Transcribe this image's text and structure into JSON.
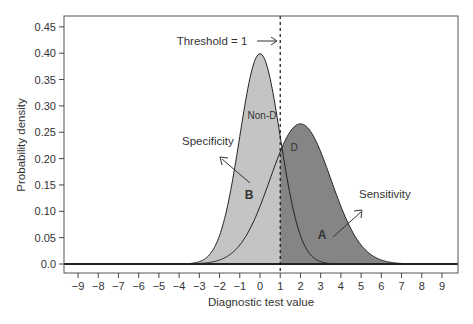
{
  "chart_data": {
    "type": "area",
    "title": "",
    "xlabel": "Diagnostic test value",
    "ylabel": "Probability density",
    "xlim": [
      -9.7,
      9.8
    ],
    "ylim": [
      -0.02,
      0.47
    ],
    "x_ticks": [
      -9,
      -8,
      -7,
      -6,
      -5,
      -4,
      -3,
      -2,
      -1,
      0,
      1,
      2,
      3,
      4,
      5,
      6,
      7,
      8,
      9
    ],
    "x_tick_labels": [
      "−9",
      "−8",
      "−7",
      "−6",
      "−5",
      "−4",
      "−3",
      "−2",
      "−1",
      "0",
      "1",
      "2",
      "3",
      "4",
      "5",
      "6",
      "7",
      "8",
      "9"
    ],
    "y_ticks": [
      0.0,
      0.05,
      0.1,
      0.15,
      0.2,
      0.25,
      0.3,
      0.35,
      0.4,
      0.45
    ],
    "y_tick_labels": [
      "0.0",
      "0.05",
      "0.10",
      "0.15",
      "0.20",
      "0.25",
      "0.30",
      "0.35",
      "0.40",
      "0.45"
    ],
    "grid": false,
    "legend": null,
    "series": [
      {
        "name": "Non-D",
        "distribution": "normal",
        "mean": 0,
        "sd": 1.0,
        "peak": 0.4,
        "fill": "#c4c4c4"
      },
      {
        "name": "D",
        "distribution": "normal",
        "mean": 2,
        "sd": 1.5,
        "peak": 0.266,
        "fill": "#858585"
      }
    ],
    "threshold": {
      "x": 1,
      "label": "Threshold = 1",
      "style": "dashed"
    },
    "annotations": [
      {
        "text": "Threshold = 1",
        "x": -0.6,
        "y": 0.41
      },
      {
        "text": "Non-D",
        "x": 0.05,
        "y": 0.285
      },
      {
        "text": "D",
        "x": 1.4,
        "y": 0.225
      },
      {
        "text": "Specificity",
        "x": -3.2,
        "y": 0.235
      },
      {
        "text": "B",
        "x": -0.55,
        "y": 0.13
      },
      {
        "text": "Sensitivity",
        "x": 5.1,
        "y": 0.135
      },
      {
        "text": "A",
        "x": 3.2,
        "y": 0.04
      }
    ],
    "regions": [
      {
        "label": "B",
        "meaning": "Specificity",
        "area": "Non-D below threshold"
      },
      {
        "label": "A",
        "meaning": "Sensitivity",
        "area": "D above threshold"
      }
    ]
  },
  "labels": {
    "xlabel": "Diagnostic test value",
    "ylabel": "Probability density",
    "threshold": "Threshold = 1",
    "arrow": "→",
    "nond": "Non-D",
    "d": "D",
    "specificity": "Specificity",
    "sensitivity": "Sensitivity",
    "a": "A",
    "b": "B"
  }
}
